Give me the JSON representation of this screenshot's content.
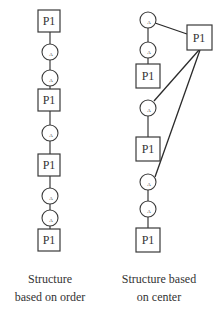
{
  "labels": {
    "process": "P1",
    "activity": "A"
  },
  "left_structure": {
    "caption_line1": "Structure",
    "caption_line2": "based on order",
    "sequence": [
      "P1",
      "A",
      "A",
      "P1",
      "A",
      "P1",
      "A",
      "A",
      "P1"
    ]
  },
  "right_structure": {
    "caption_line1": "Structure based",
    "caption_line2": "on center",
    "hub": "P1",
    "sequence": [
      "A",
      "A",
      "P1",
      "A",
      "P1",
      "A",
      "A",
      "P1"
    ],
    "hub_connections": [
      "A (top)",
      "A (middle)",
      "A (lower)"
    ]
  },
  "colors": {
    "stroke": "#3a3a3a",
    "text": "#333333",
    "background": "#ffffff"
  }
}
